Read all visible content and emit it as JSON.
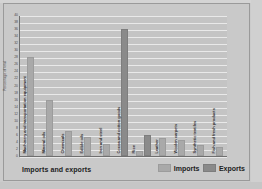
{
  "chart_data": {
    "type": "bar",
    "title": "Imports and exports",
    "xlabel": "",
    "ylabel": "Percentage of total",
    "ylim": [
      0,
      40
    ],
    "ytick_step": 2,
    "yticks": [
      "0",
      "2",
      "4",
      "6",
      "8",
      "10",
      "12",
      "14",
      "16",
      "18",
      "20",
      "22",
      "24",
      "26",
      "28",
      "30",
      "32",
      "34",
      "36",
      "38",
      "40"
    ],
    "grid": true,
    "legend_position": "bottom-right",
    "categories": [
      "Machinery and transportation equipment",
      "Mineral oils",
      "Chemicals",
      "Edible oils",
      "Iron and steel",
      "Cocoa and cotton goods",
      "Rice",
      "Leather",
      "Woolen carpets",
      "Synthetic textiles",
      "Fish and fresh products"
    ],
    "series": [
      {
        "name": "Imports",
        "color": "#a9a9a9",
        "values": [
          28,
          16,
          7,
          5.5,
          3.5,
          0,
          1.5,
          5,
          4.5,
          3,
          2.5
        ]
      },
      {
        "name": "Exports",
        "color": "#8a8a8a",
        "values": [
          0,
          0,
          0,
          0,
          0,
          36,
          6,
          0,
          0,
          0,
          0
        ]
      }
    ]
  },
  "chart": {
    "title": "Imports and exports",
    "ylabel": "Percentage of total"
  },
  "legend": {
    "items": [
      {
        "label": "Imports",
        "swatch": "imports-swatch"
      },
      {
        "label": "Exports",
        "swatch": "exports-swatch"
      }
    ]
  }
}
